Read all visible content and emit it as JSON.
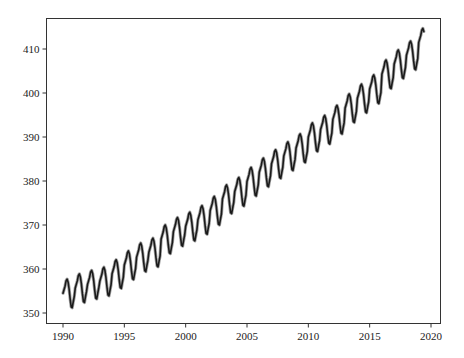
{
  "chart_data": {
    "type": "line",
    "title": "",
    "xlabel": "",
    "ylabel": "",
    "xlim": [
      1988.6,
      2020.6
    ],
    "ylim": [
      348.1,
      416.9
    ],
    "grid": false,
    "legend": null,
    "xticks": [
      1990,
      1995,
      2000,
      2005,
      2010,
      2015,
      2020
    ],
    "xtick_labels": [
      "1990",
      "1995",
      "2000",
      "2005",
      "2010",
      "2015",
      "2020"
    ],
    "yticks": [
      350,
      360,
      370,
      380,
      390,
      400,
      410
    ],
    "ytick_labels": [
      "350",
      "360",
      "370",
      "380",
      "390",
      "400",
      "410"
    ],
    "line_color": "#1a1a1a",
    "series": [
      {
        "name": "monthly CO2 (ppm)",
        "x_start": 1990.0,
        "x_step": 0.0833333,
        "annual_means": [
          354.4,
          355.6,
          356.4,
          357.1,
          358.8,
          360.8,
          362.6,
          363.7,
          366.7,
          368.4,
          369.6,
          371.1,
          373.2,
          375.8,
          377.5,
          379.8,
          381.9,
          383.8,
          385.6,
          387.4,
          389.9,
          391.6,
          393.9,
          396.5,
          398.7,
          400.8,
          404.2,
          406.5,
          408.5,
          411.4
        ],
        "seasonal_offsets": [
          0.1,
          0.9,
          1.7,
          2.9,
          3.3,
          2.6,
          1.0,
          -1.2,
          -3.0,
          -3.2,
          -1.9,
          -0.7
        ]
      }
    ]
  }
}
